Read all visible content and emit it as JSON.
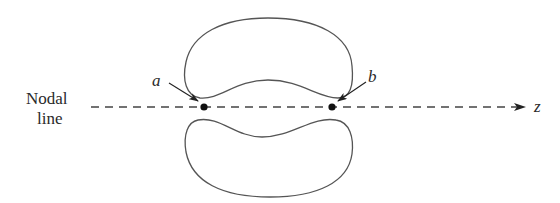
{
  "diagram": {
    "nodal_label_line1": "Nodal",
    "nodal_label_line2": "line",
    "point_a": "a",
    "point_b": "b",
    "axis_label": "z",
    "colors": {
      "stroke": "#555555",
      "dash": "#444444",
      "dot": "#111111",
      "text": "#2a2a2a"
    }
  }
}
